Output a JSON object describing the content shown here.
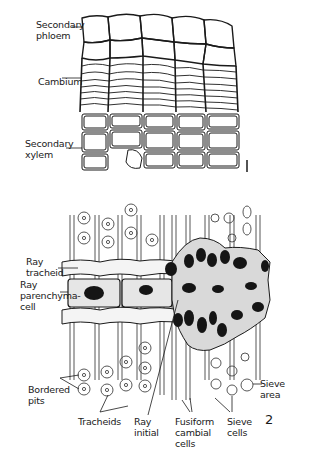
{
  "figure1": {
    "number": "1",
    "labels": {
      "secondary_phloem": "Secondary\nphloem",
      "cambium": "Cambium",
      "secondary_xylem": "Secondary\nxylem"
    }
  },
  "figure2": {
    "number": "2",
    "labels": {
      "ray_tracheid": "Ray\ntracheid",
      "ray_parenchyma_cell": "Ray\nparenchyma-\ncell",
      "bordered_pits": "Bordered\npits",
      "tracheids": "Tracheids",
      "ray_initial": "Ray\ninitial",
      "fusiform_cambial_cells": "Fusiform\ncambial\ncells",
      "sieve_cells": "Sieve\ncells",
      "sieve_area": "Sieve\narea"
    }
  },
  "colors": {
    "ink": "#1a1a1a",
    "nucleus": "#151515",
    "cell_fill": "#d9d9d9",
    "background": "#ffffff"
  }
}
